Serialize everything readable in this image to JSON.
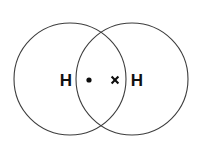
{
  "figure": {
    "background_color": "#ffffff",
    "stroke_color": "#3d3d3d",
    "marker_color": "#0d0d0d",
    "label_color": "#111111",
    "width": 204,
    "height": 149
  },
  "atoms": [
    {
      "id": "atom-left",
      "symbol": "H",
      "label_x": 66,
      "label_y": 80
    },
    {
      "id": "atom-right",
      "symbol": "H",
      "label_x": 137,
      "label_y": 80
    }
  ],
  "shells": [
    {
      "id": "shell-left",
      "cx": 70,
      "cy": 79,
      "r": 56
    },
    {
      "id": "shell-right",
      "cx": 132,
      "cy": 79,
      "r": 56
    }
  ],
  "electrons": [
    {
      "id": "electron-dot",
      "marker": "dot",
      "symbol": "•",
      "cx": 89,
      "cy": 80,
      "radius": 2.6
    },
    {
      "id": "electron-cross",
      "marker": "cross",
      "symbol": "×",
      "cx": 115,
      "cy": 80,
      "half_size": 3.4
    }
  ]
}
